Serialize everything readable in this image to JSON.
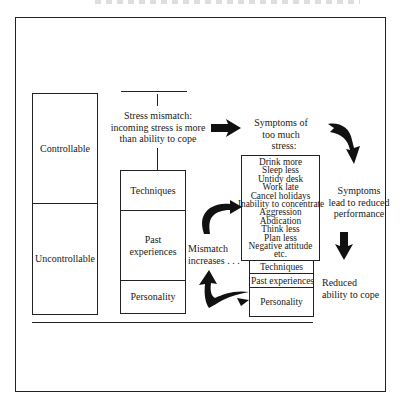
{
  "diagram": {
    "left_column": {
      "top_label": "Controllable",
      "bottom_label": "Uncontrollable"
    },
    "mismatch_label": "Stress mismatch: incoming stress is more than ability to cope",
    "mismatch_lines": [
      "Stress mismatch:",
      "incoming stress is more",
      "than ability to cope"
    ],
    "coping_stack": {
      "items": [
        "Techniques",
        "Past experiences",
        "Personality"
      ],
      "past_lines": [
        "Past",
        "experiences"
      ]
    },
    "symptoms_heading": [
      "Symptoms of",
      "too much",
      "stress:"
    ],
    "symptoms_list": [
      "Drink more",
      "Sleep less",
      "Untidy desk",
      "Work late",
      "Cancel holidays",
      "Inability to concentrate",
      "Aggression",
      "Abdication",
      "Think less",
      "Plan less",
      "Negative attitude",
      "etc."
    ],
    "reduced_stack": {
      "items": [
        "Techniques",
        "Past experiences",
        "Personality"
      ]
    },
    "mismatch_increases": [
      "Mismatch",
      "increases . . ."
    ],
    "performance_label": [
      "Symptoms",
      "lead to reduced",
      "performance"
    ],
    "reduced_ability_label": [
      "Reduced",
      "ability to cope"
    ],
    "colors": {
      "line": "#222222",
      "background": "#ffffff",
      "text": "#1a1a1a"
    },
    "icons": [
      "arrow-right-icon",
      "curved-arrow-down-icon",
      "arrow-down-icon",
      "curved-arrow-up-right-icon",
      "curved-arrow-up-left-icon"
    ]
  }
}
